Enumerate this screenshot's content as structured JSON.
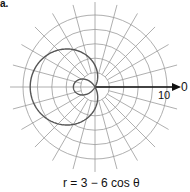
{
  "figure": {
    "part_label": "a.",
    "axis_zero_label": "0",
    "radius_label": "10",
    "equation": "r = 3 − 6 cos θ",
    "colors": {
      "grid": "#9a9a9a",
      "curve": "#555555",
      "axis": "#111111"
    }
  },
  "chart_data": {
    "type": "polar",
    "title": "r = 3 − 6 cos θ",
    "curve": "limaçon with inner loop",
    "equation": {
      "a": 3,
      "b": -6,
      "function": "cos"
    },
    "grid": {
      "circles": [
        2,
        4,
        6,
        8,
        10
      ],
      "radial_lines_deg_step": 15
    },
    "axis_labels": {
      "polar_axis": "0",
      "max_radius": "10"
    },
    "key_points": [
      {
        "theta_deg": 0,
        "r": -3
      },
      {
        "theta_deg": 90,
        "r": 3
      },
      {
        "theta_deg": 180,
        "r": 9
      },
      {
        "theta_deg": 270,
        "r": 3
      }
    ]
  }
}
